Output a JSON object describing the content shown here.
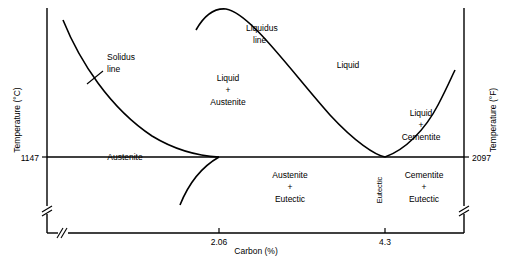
{
  "diagram": {
    "axes": {
      "y_left_label": "Temperature (°C)",
      "y_right_label": "Temperature (°F)",
      "x_label": "Carbon (%)",
      "y_left_tick": "1147",
      "y_right_tick": "2097",
      "x_ticks": [
        "2.06",
        "4.3"
      ]
    },
    "labels": {
      "solidus": "Solidus\nline",
      "solidus_l1": "Solidus",
      "solidus_l2": "line",
      "liquidus_l1": "Liquidus",
      "liquidus_l2": "line",
      "liquid": "Liquid",
      "liquid_austenite_l1": "Liquid",
      "liquid_austenite_l2": "+",
      "liquid_austenite_l3": "Austenite",
      "liquid_cementite_l1": "Liquid",
      "liquid_cementite_l2": "+",
      "liquid_cementite_l3": "Cementite",
      "austenite": "Austenite",
      "austenite_eutectic_l1": "Austenite",
      "austenite_eutectic_l2": "+",
      "austenite_eutectic_l3": "Eutectic",
      "cementite_eutectic_l1": "Cementite",
      "cementite_eutectic_l2": "+",
      "cementite_eutectic_l3": "Eutectic",
      "eutectic": "Eutectic"
    }
  }
}
